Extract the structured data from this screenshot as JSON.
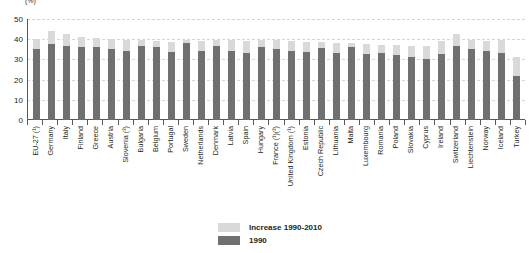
{
  "chart_data": {
    "type": "bar",
    "title": "",
    "subtitle": "",
    "unit_label": "(%)",
    "xlabel": "",
    "ylabel": "",
    "ylim": [
      0,
      50
    ],
    "yticks": [
      0,
      10,
      20,
      30,
      40,
      50
    ],
    "grid": true,
    "stacked": true,
    "legend_position": "bottom-center",
    "categories": [
      "EU-27 (¹)",
      "Germany",
      "Italy",
      "Finland",
      "Greece",
      "Austria",
      "Slovenia (²)",
      "Bulgaria",
      "Belgium",
      "Portugal",
      "Sweden",
      "Netherlands",
      "Denmark",
      "Latvia",
      "Spain",
      "Hungary",
      "France (¹)(²)",
      "United Kingdom (¹)",
      "Estonia",
      "Czech Republic",
      "Lithuania",
      "Malta",
      "Luxembourg",
      "Romania",
      "Poland",
      "Slovakia",
      "Cyprus",
      "Ireland",
      "Switzerland",
      "Liechtenstein",
      "Norway",
      "Iceland",
      "Turkey"
    ],
    "series": [
      {
        "name": "1990",
        "color": "#6f7072",
        "values": [
          35.0,
          37.5,
          36.8,
          36.2,
          36.0,
          35.4,
          34.0,
          36.4,
          36.0,
          33.6,
          38.0,
          34.2,
          36.7,
          34.3,
          33.0,
          36.0,
          35.0,
          34.0,
          33.6,
          35.5,
          33.4,
          36.0,
          32.5,
          33.0,
          32.0,
          31.0,
          30.4,
          32.5,
          36.8,
          35.0,
          34.0,
          33.0,
          22.0
        ]
      },
      {
        "name": "Increase 1990-2010",
        "color": "#d9d9d9",
        "values": [
          5.2,
          6.5,
          5.6,
          4.8,
          4.8,
          4.6,
          5.8,
          3.3,
          3.3,
          5.2,
          1.6,
          5.0,
          3.0,
          5.2,
          6.2,
          3.5,
          4.4,
          5.2,
          5.0,
          2.9,
          4.6,
          2.0,
          5.0,
          4.2,
          5.3,
          5.6,
          6.2,
          6.5,
          5.6,
          4.6,
          5.2,
          6.8,
          9.0
        ]
      }
    ],
    "totals": [
      40.2,
      44.0,
      42.4,
      41.0,
      40.8,
      40.0,
      39.8,
      39.7,
      39.3,
      38.8,
      39.6,
      39.2,
      39.7,
      39.5,
      39.2,
      39.5,
      39.4,
      39.2,
      38.6,
      38.4,
      38.0,
      38.0,
      37.5,
      37.2,
      37.3,
      36.6,
      36.6,
      39.0,
      42.4,
      39.6,
      39.2,
      39.8,
      31.0
    ]
  },
  "legend": {
    "items": [
      {
        "label": "Increase 1990-2010",
        "swatch": "sw-increase"
      },
      {
        "label": "1990",
        "swatch": "sw-1990"
      }
    ]
  },
  "colors": {
    "bar_1990": "#6f7072",
    "bar_increase": "#d9d9d9",
    "gridline": "#cfd6de",
    "axis": "#58595b",
    "text": "#231f20",
    "background": "#ffffff"
  }
}
